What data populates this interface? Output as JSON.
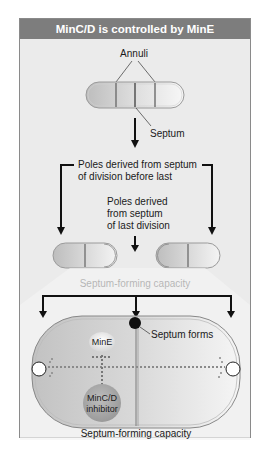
{
  "title": "MinC/D is controlled by MinE",
  "labels": {
    "annuli": "Annuli",
    "septum": "Septum",
    "poles_before_last_1": "Poles derived from septum",
    "poles_before_last_2": "of division before last",
    "poles_last_1": "Poles derived",
    "poles_last_2": "from septum",
    "poles_last_3": "of last division",
    "capacity_top": "Septum-forming capacity",
    "septum_forms": "Septum forms",
    "mine": "MinE",
    "mincd_1": "MinC/D",
    "mincd_2": "inhibitor",
    "capacity_bottom": "Septum-forming capacity"
  },
  "colors": {
    "header_bg": "#7d7d7d",
    "panel_bg": "#ebebeb",
    "cell_dark": "#c4c4c4",
    "cell_light": "#f2f2f2",
    "inhibitor": "#a8a8a8",
    "arrow": "#111111"
  }
}
